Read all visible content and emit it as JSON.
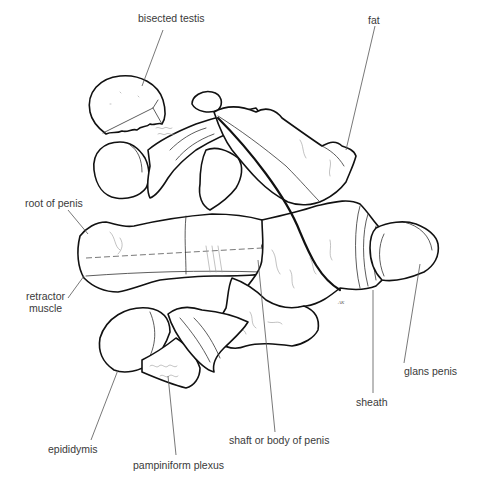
{
  "figure": {
    "type": "anatomical line drawing",
    "labels": [
      {
        "id": "bisected_testis",
        "text": "bisected testis",
        "x": 163,
        "y": 20
      },
      {
        "id": "fat",
        "text": "fat",
        "x": 375,
        "y": 16
      },
      {
        "id": "root_of_penis",
        "text": "root of penis",
        "x": 25,
        "y": 200
      },
      {
        "id": "retractor_muscle",
        "text": "retractor\nmuscle",
        "x": 26,
        "y": 291
      },
      {
        "id": "glans_penis",
        "text": "glans penis",
        "x": 404,
        "y": 371
      },
      {
        "id": "sheath",
        "text": "sheath",
        "x": 356,
        "y": 400
      },
      {
        "id": "shaft_or_body_of_penis",
        "text": "shaft or body of penis",
        "x": 229,
        "y": 436
      },
      {
        "id": "epididymis",
        "text": "epididymis",
        "x": 48,
        "y": 445
      },
      {
        "id": "pampiniform_plexus",
        "text": "pampiniform plexus",
        "x": 133,
        "y": 462
      }
    ],
    "signature": "AK"
  }
}
